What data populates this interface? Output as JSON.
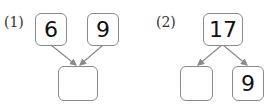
{
  "problems": [
    {
      "label": "(1)",
      "top_left": "6",
      "top_right": "9",
      "bottom": ""
    },
    {
      "label": "(2)",
      "top": "17",
      "bottom_left": "",
      "bottom_right": "9"
    }
  ],
  "colors": {
    "border": "#8a8a8a",
    "arrow": "#8a8a8a",
    "text": "#111111"
  }
}
